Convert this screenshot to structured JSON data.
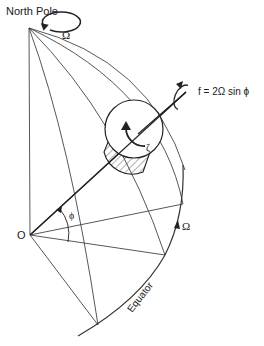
{
  "diagram": {
    "labels": {
      "north_pole": "North Pole",
      "omega_pole": "Ω",
      "coriolis": "f = 2Ω sin ϕ",
      "zeta": "ζ",
      "origin": "O",
      "phi": "ϕ",
      "omega_equator": "Ω",
      "equator": "Equator"
    },
    "colors": {
      "stroke": "#333333",
      "text": "#222222",
      "background": "#ffffff"
    }
  }
}
